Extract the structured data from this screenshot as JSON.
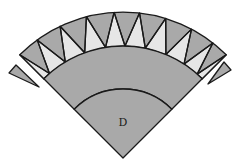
{
  "diagram": {
    "title_fragment": "",
    "center_label": "D",
    "colors": {
      "dark_fill": "#a9a9a9",
      "light_fill": "#e6e6e6",
      "stroke": "#1a1a1a",
      "background": "#ffffff"
    },
    "geometry": {
      "apex": [
        123,
        158
      ],
      "outer_radius": 146,
      "band_inner_radius": 112,
      "inner_arc_radius": 69,
      "half_angle_deg": 45,
      "zigzag_outer_angles_deg": [
        -45,
        -36,
        -25.5,
        -14.5,
        -3.5,
        6.5,
        17,
        28,
        38,
        45
      ],
      "zigzag_inner_angles_deg": [
        -41,
        -31,
        -20,
        -9,
        1,
        11.5,
        22.5,
        33,
        41.5
      ],
      "detached_pieces": [
        {
          "name": "left-detached-triangle",
          "points": [
            [
              9,
              73
            ],
            [
              16,
              65
            ],
            [
              39,
              87
            ]
          ]
        },
        {
          "name": "right-detached-triangle",
          "points": [
            [
              231,
              70
            ],
            [
              224,
              62
            ],
            [
              208,
              84
            ]
          ]
        }
      ]
    },
    "pieces": [
      "outer-pieced-band",
      "middle-arc-band",
      "center-sector-D"
    ]
  }
}
